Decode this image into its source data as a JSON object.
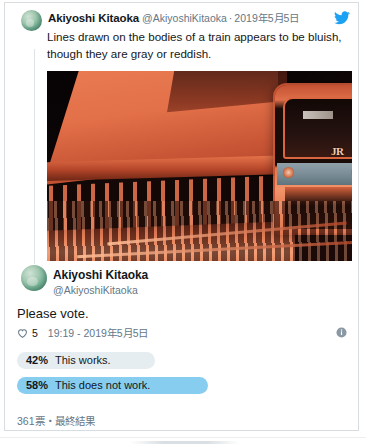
{
  "app": {
    "platform": "Twitter",
    "brand_color": "#1da1f2"
  },
  "tweet_main": {
    "display_name": "Akiyoshi Kitaoka",
    "handle": "@AkiyoshiKitaoka",
    "separator": "·",
    "date": "2019年5月5日",
    "text": "Lines drawn on the bodies of a train appears to be bluish, though they are gray or reddish.",
    "media": {
      "alt": "train-photo",
      "description": "Orange-tinted photograph of a JR train at a station platform"
    },
    "icons": {
      "bird": "twitter-bird-icon",
      "avatar": "avatar-image"
    }
  },
  "tweet_reply": {
    "display_name": "Akiyoshi Kitaoka",
    "handle": "@AkiyoshiKitaoka",
    "text": "Please vote.",
    "like_count": "5",
    "timestamp": "19:19 - 2019年5月5日",
    "info_icon": "info-icon",
    "heart_icon": "heart-icon"
  },
  "poll": {
    "options": [
      {
        "percent_label": "42%",
        "percent_value": 42,
        "text": "This works.",
        "fill_color": "#e6edf0",
        "leading": false
      },
      {
        "percent_label": "58%",
        "percent_value": 58,
        "text": "This does not work.",
        "fill_color": "#86cdf0",
        "leading": true
      }
    ],
    "footer": "361票・最終結果"
  }
}
